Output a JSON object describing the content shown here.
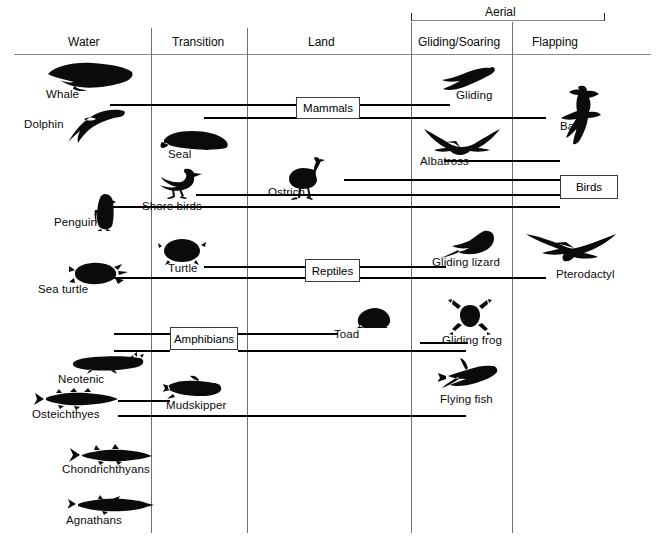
{
  "diagram": {
    "title_columns": [
      "Water",
      "Transition",
      "Land",
      "Gliding/Soaring",
      "Flapping"
    ],
    "group_bracket": {
      "label": "Aerial",
      "spans": [
        "Gliding/Soaring",
        "Flapping"
      ]
    },
    "group_boxes": [
      {
        "label": "Mammals"
      },
      {
        "label": "Birds"
      },
      {
        "label": "Reptiles"
      },
      {
        "label": "Amphibians"
      }
    ],
    "organisms": [
      {
        "label": "Whale",
        "column": "Water",
        "icon": "whale-silhouette"
      },
      {
        "label": "Dolphin",
        "column": "Water",
        "icon": "dolphin-silhouette"
      },
      {
        "label": "Seal",
        "column": "Transition",
        "icon": "seal-silhouette"
      },
      {
        "label": "Shore birds",
        "column": "Transition",
        "icon": "shorebird-silhouette"
      },
      {
        "label": "Penguin",
        "column": "Water",
        "icon": "penguin-silhouette"
      },
      {
        "label": "Turtle",
        "column": "Transition",
        "icon": "turtle-silhouette"
      },
      {
        "label": "Sea turtle",
        "column": "Water",
        "icon": "sea-turtle-silhouette"
      },
      {
        "label": "Neotenic",
        "column": "Water",
        "icon": "neotenic-salamander-silhouette"
      },
      {
        "label": "Osteichthyes",
        "column": "Water",
        "icon": "bony-fish-silhouette"
      },
      {
        "label": "Chondrichthyans",
        "column": "Water",
        "icon": "shark-silhouette"
      },
      {
        "label": "Agnathans",
        "column": "Water",
        "icon": "lamprey-silhouette"
      },
      {
        "label": "Mudskipper",
        "column": "Transition",
        "icon": "mudskipper-silhouette"
      },
      {
        "label": "Ostrich",
        "column": "Land",
        "icon": "ostrich-silhouette"
      },
      {
        "label": "Toad",
        "column": "Land",
        "icon": "toad-silhouette"
      },
      {
        "label": "Gliding",
        "column": "Gliding/Soaring",
        "icon": "flying-squirrel-silhouette"
      },
      {
        "label": "Albatross",
        "column": "Gliding/Soaring",
        "icon": "albatross-silhouette"
      },
      {
        "label": "Gliding lizard",
        "column": "Gliding/Soaring",
        "icon": "gliding-lizard-silhouette"
      },
      {
        "label": "Gliding frog",
        "column": "Gliding/Soaring",
        "icon": "gliding-frog-silhouette"
      },
      {
        "label": "Flying fish",
        "column": "Gliding/Soaring",
        "icon": "flying-fish-silhouette"
      },
      {
        "label": "Bat",
        "column": "Flapping",
        "icon": "bat-silhouette"
      },
      {
        "label": "Pterodactyl",
        "column": "Flapping",
        "icon": "pterodactyl-silhouette"
      }
    ]
  }
}
